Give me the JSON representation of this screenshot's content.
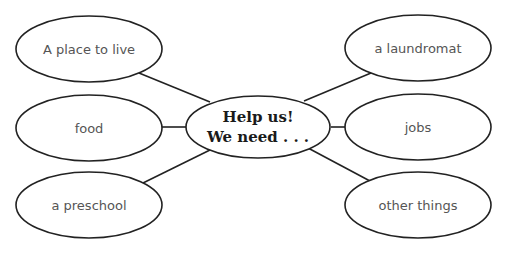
{
  "diagram": {
    "type": "concept-web",
    "center": {
      "line1": "Help us!",
      "line2": "We need . . ."
    },
    "nodes": [
      {
        "id": "place-to-live",
        "label": "A place to live",
        "side": "left",
        "position": "top"
      },
      {
        "id": "food",
        "label": "food",
        "side": "left",
        "position": "middle"
      },
      {
        "id": "preschool",
        "label": "a preschool",
        "side": "left",
        "position": "bottom"
      },
      {
        "id": "laundromat",
        "label": "a laundromat",
        "side": "right",
        "position": "top"
      },
      {
        "id": "jobs",
        "label": "jobs",
        "side": "right",
        "position": "middle"
      },
      {
        "id": "other-things",
        "label": "other things",
        "side": "right",
        "position": "bottom"
      }
    ],
    "colors": {
      "stroke": "#222222",
      "node_text": "#555555",
      "center_text": "#1a1a1a",
      "background": "#ffffff"
    }
  }
}
